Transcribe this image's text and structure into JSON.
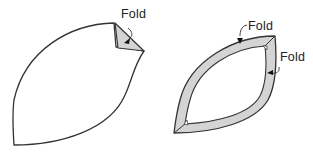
{
  "diagram": {
    "type": "folding-steps",
    "colors": {
      "outline": "#333333",
      "fold_fill": "#d4d4d4",
      "background": "#ffffff"
    },
    "step1": {
      "shape": "leaf / football-shaped piece with one corner folded",
      "label": "Fold"
    },
    "step2": {
      "shape": "leaf-shaped piece with all edges folded inward forming a border",
      "labels": [
        "Fold",
        "Fold"
      ]
    }
  }
}
